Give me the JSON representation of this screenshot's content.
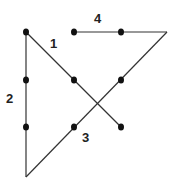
{
  "diagram": {
    "colors": {
      "line": "#333333",
      "dot": "#111111",
      "background": "#ffffff"
    },
    "dots": [
      {
        "x": 26,
        "y": 32
      },
      {
        "x": 74,
        "y": 32
      },
      {
        "x": 121,
        "y": 32
      },
      {
        "x": 26,
        "y": 80
      },
      {
        "x": 74,
        "y": 80
      },
      {
        "x": 121,
        "y": 80
      },
      {
        "x": 26,
        "y": 127
      },
      {
        "x": 74,
        "y": 127
      },
      {
        "x": 121,
        "y": 127
      }
    ],
    "segments": [
      {
        "label": "1",
        "from": {
          "x": 26,
          "y": 32
        },
        "to": {
          "x": 121,
          "y": 127
        },
        "label_pos": {
          "x": 50,
          "y": 48
        }
      },
      {
        "label": "2",
        "from": {
          "x": 26,
          "y": 32
        },
        "to": {
          "x": 26,
          "y": 177
        },
        "label_pos": {
          "x": 8,
          "y": 103
        }
      },
      {
        "label": "3",
        "from": {
          "x": 26,
          "y": 177
        },
        "to": {
          "x": 167,
          "y": 32
        },
        "label_pos": {
          "x": 82,
          "y": 141
        }
      },
      {
        "label": "4",
        "from": {
          "x": 167,
          "y": 32
        },
        "to": {
          "x": 74,
          "y": 32
        },
        "label_pos": {
          "x": 94,
          "y": 23
        }
      }
    ]
  }
}
